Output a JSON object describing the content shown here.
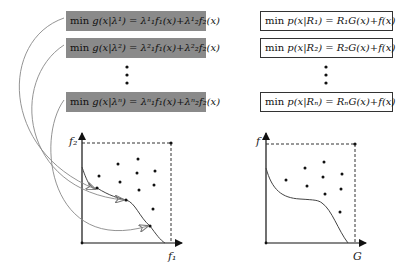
{
  "left_panel": {
    "boxes": [
      {
        "op": "min",
        "expr": "g(x|λ¹) = λ¹₁f₁(x)+λ¹₂f₂(x)"
      },
      {
        "op": "min",
        "expr": "g(x|λ²) = λ²₁f₁(x)+λ²₂f₂(x)"
      },
      {
        "op": "min",
        "expr": "g(x|λⁿ) = λⁿ₁f₁(x)+λⁿ₂f₂(x)"
      }
    ],
    "ellipsis": "⋮",
    "x_axis_label": "f₁",
    "y_axis_label": "f₂",
    "box_color": "#8a8a8a"
  },
  "right_panel": {
    "boxes": [
      {
        "op": "min",
        "expr": "p(x|R₁) = R₁G(x)+f(x)"
      },
      {
        "op": "min",
        "expr": "p(x|R₂) = R₂G(x)+f(x)"
      },
      {
        "op": "min",
        "expr": "p(x|Rₙ) = RₙG(x)+f(x)"
      }
    ],
    "ellipsis": "⋮",
    "x_axis_label": "G",
    "y_axis_label": "f"
  }
}
